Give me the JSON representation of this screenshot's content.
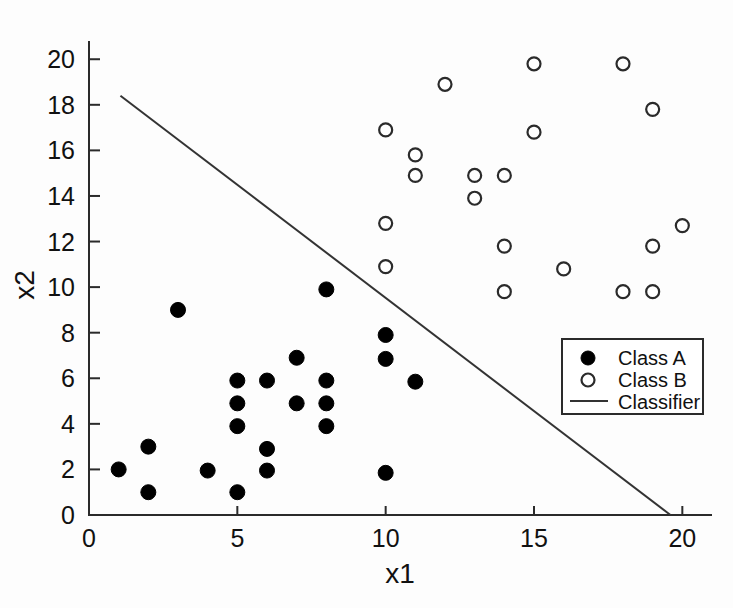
{
  "chart_data": {
    "type": "scatter",
    "title": "",
    "xlabel": "x1",
    "ylabel": "x2",
    "xlim": [
      0,
      21
    ],
    "ylim": [
      0,
      20.8
    ],
    "xticks": [
      0,
      5,
      10,
      15,
      20
    ],
    "xticklabels": [
      "0",
      "5",
      "10",
      "15",
      "20"
    ],
    "yticks": [
      0,
      2,
      4,
      6,
      8,
      10,
      12,
      14,
      16,
      18,
      20
    ],
    "yticklabels": [
      "0",
      "2",
      "4",
      "6",
      "8",
      "10",
      "12",
      "14",
      "16",
      "18",
      "20"
    ],
    "grid": false,
    "legend_position": "right-middle",
    "series": [
      {
        "name": "Class A",
        "marker": "filled-circle",
        "color": "#000000",
        "points": [
          [
            1,
            2.0
          ],
          [
            2,
            3.0
          ],
          [
            2,
            1.0
          ],
          [
            3,
            9.0
          ],
          [
            4,
            1.95
          ],
          [
            5,
            5.9
          ],
          [
            5,
            4.9
          ],
          [
            5,
            3.9
          ],
          [
            5,
            1.0
          ],
          [
            6,
            5.9
          ],
          [
            6,
            2.9
          ],
          [
            6,
            1.95
          ],
          [
            7,
            6.9
          ],
          [
            7,
            4.9
          ],
          [
            8,
            9.9
          ],
          [
            8,
            5.9
          ],
          [
            8,
            4.9
          ],
          [
            8,
            3.9
          ],
          [
            10,
            7.9
          ],
          [
            10,
            6.85
          ],
          [
            10,
            1.85
          ],
          [
            11,
            5.85
          ]
        ]
      },
      {
        "name": "Class B",
        "marker": "open-circle",
        "color": "#ffffff",
        "points": [
          [
            10,
            16.9
          ],
          [
            10,
            12.8
          ],
          [
            10,
            10.9
          ],
          [
            11,
            15.8
          ],
          [
            11,
            14.9
          ],
          [
            12,
            18.9
          ],
          [
            13,
            14.9
          ],
          [
            13,
            13.9
          ],
          [
            14,
            14.9
          ],
          [
            14,
            11.8
          ],
          [
            14,
            9.8
          ],
          [
            15,
            19.8
          ],
          [
            15,
            16.8
          ],
          [
            16,
            10.8
          ],
          [
            18,
            19.8
          ],
          [
            18,
            9.8
          ],
          [
            19,
            17.8
          ],
          [
            19,
            11.8
          ],
          [
            19,
            9.8
          ],
          [
            20,
            12.7
          ]
        ]
      }
    ],
    "lines": [
      {
        "name": "Classifier",
        "color": "#333333",
        "x": [
          1.06,
          19.6
        ],
        "y": [
          18.4,
          0.0
        ]
      }
    ],
    "legend": [
      {
        "label": "Class A",
        "marker": "filled-circle"
      },
      {
        "label": "Class B",
        "marker": "open-circle"
      },
      {
        "label": "Classifier",
        "marker": "line"
      }
    ]
  }
}
